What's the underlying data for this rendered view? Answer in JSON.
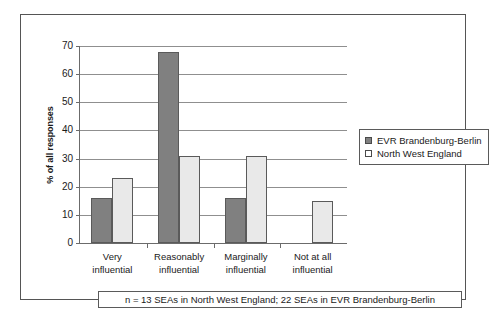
{
  "chart_data": {
    "type": "bar",
    "title": "",
    "subtitle": "",
    "xlabel": "",
    "ylabel": "% of all responses",
    "ylim": [
      0,
      70
    ],
    "ytick_step": 10,
    "yticks": [
      0,
      10,
      20,
      30,
      40,
      50,
      60,
      70
    ],
    "ytick_labels": [
      "0",
      "10",
      "20",
      "30",
      "40",
      "50",
      "60",
      "70"
    ],
    "grid": true,
    "grid_axis": "y",
    "legend_position": "right",
    "categories": [
      "Very influential",
      "Reasonably influential",
      "Marginally influential",
      "Not at all influential"
    ],
    "category_lines": [
      [
        "Very",
        "influential"
      ],
      [
        "Reasonably",
        "influential"
      ],
      [
        "Marginally",
        "influential"
      ],
      [
        "Not at all",
        "influential"
      ]
    ],
    "series": [
      {
        "name": "EVR Brandenburg-Berlin",
        "color": "#808080",
        "values": [
          16,
          68,
          16,
          0
        ]
      },
      {
        "name": "North West England",
        "color": "#e9e9e9",
        "values": [
          23,
          31,
          31,
          15
        ]
      }
    ],
    "annotation": "n = 13 SEAs in North West England; 22 SEAs in EVR Brandenburg-Berlin"
  },
  "legend": {
    "entries": [
      {
        "label": "EVR Brandenburg-Berlin",
        "swatch_color": "#808080"
      },
      {
        "label": "North West England",
        "swatch_color": "#ffffff"
      }
    ]
  },
  "caption": {
    "text": "n = 13 SEAs in North West England; 22 SEAs in EVR Brandenburg-Berlin"
  },
  "axes": {
    "y_title": "% of all responses"
  }
}
